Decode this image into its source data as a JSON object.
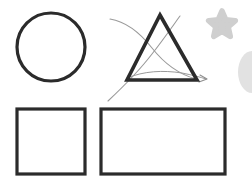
{
  "canvas": {
    "width": 252,
    "height": 188,
    "background_color": "#ffffff",
    "title": "Shapes Canvas"
  },
  "palette": {
    "stroke_dark": "#2b2b2b",
    "stroke_dark_soft": "#333333",
    "annotation_gray": "#9a9a9a",
    "sticker_gray": "#cfcfcf",
    "sticker_gray_soft": "#e2e2e2",
    "fill_none": "none"
  },
  "shapes": [
    {
      "id": "circle",
      "name": "circle",
      "label": "Circle",
      "type": "circle",
      "stroke_color": "#2b2b2b",
      "stroke_width": 3.2,
      "fill": "none",
      "cx": 51,
      "cy": 47,
      "r": 34
    },
    {
      "id": "triangle",
      "name": "triangle",
      "label": "Triangle",
      "type": "polygon",
      "stroke_color": "#2b2b2b",
      "stroke_width": 3.6,
      "fill": "none",
      "points": "160,15 197,80 127,80"
    },
    {
      "id": "square",
      "name": "square",
      "label": "Square",
      "type": "rect",
      "stroke_color": "#2b2b2b",
      "stroke_width": 3.2,
      "fill": "none",
      "x": 17,
      "y": 109,
      "width": 68,
      "height": 65
    },
    {
      "id": "rectangle",
      "name": "rectangle",
      "label": "Rectangle",
      "type": "rect",
      "stroke_color": "#2b2b2b",
      "stroke_width": 3.2,
      "fill": "none",
      "x": 101,
      "y": 109,
      "width": 124,
      "height": 65
    }
  ],
  "annotations": [
    {
      "id": "ink-stroke-1",
      "name": "ink-curve-descending",
      "label": "Hand drawn curve descending to the right",
      "stroke_color": "#9a9a9a",
      "stroke_width": 1.1,
      "path": "M110,19 C128,22 141,34 152,48 C163,62 178,74 196,79"
    },
    {
      "id": "ink-stroke-2",
      "name": "ink-curve-ascending",
      "label": "Hand drawn curve ascending to the right",
      "stroke_color": "#9a9a9a",
      "stroke_width": 1.1,
      "path": "M108,101 C124,86 139,71 152,54 C163,40 172,27 180,16"
    },
    {
      "id": "ink-stroke-3",
      "name": "ink-curve-base-sweep",
      "label": "Hand drawn sweep across the triangle base",
      "stroke_color": "#9a9a9a",
      "stroke_width": 1.0,
      "path": "M127,78 C144,71 163,70 182,73 C192,75 200,77 206,79"
    },
    {
      "id": "ink-arrowhead",
      "name": "ink-arrowhead",
      "label": "Arrowhead terminating the annotation curve",
      "stroke_color": "#8e8e8e",
      "stroke_width": 1.1,
      "path": "M200,75 L207,79 L199,82"
    }
  ],
  "stickers": [
    {
      "id": "star-sticker",
      "name": "star-sticker",
      "label": "Star sticker",
      "fill_color": "#cfcfcf",
      "cx": 222,
      "cy": 25,
      "size": 28
    },
    {
      "id": "blob-sticker",
      "name": "blob-sticker",
      "label": "Partially visible rounded sticker at right edge",
      "fill_color": "#e2e2e2",
      "cx": 252,
      "cy": 72,
      "rx": 14,
      "ry": 21
    }
  ]
}
